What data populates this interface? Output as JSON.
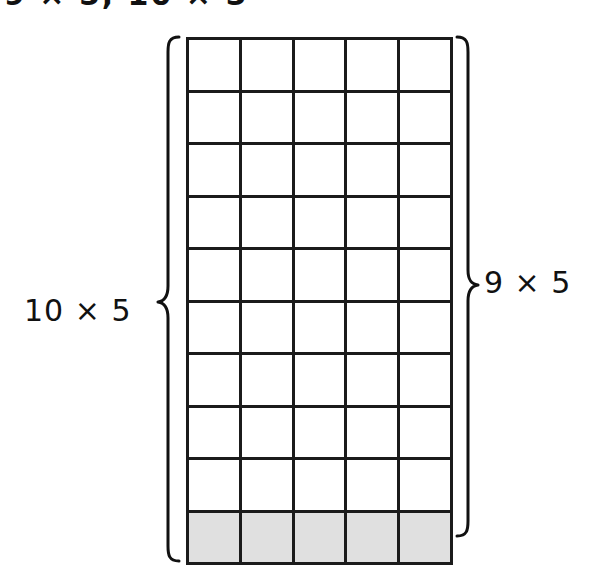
{
  "heading": {
    "text": "9 × 5, 10 × 5",
    "note": "cropped-top-text"
  },
  "diagram": {
    "type": "area-model-grid",
    "columns": 5,
    "rows": 10,
    "shaded_rows": 1,
    "unshaded_rows": 9,
    "shaded_row_indices": [
      9
    ],
    "grid_line_color": "#1b1b1b",
    "shaded_fill_color": "#e0e0e0",
    "unshaded_fill_color": "#ffffff"
  },
  "left_brace": {
    "label": "10 × 5",
    "spans_rows": 10,
    "glyph": "left-curly-brace"
  },
  "right_brace": {
    "label": "9 × 5",
    "spans_rows": 9,
    "glyph": "right-curly-brace"
  },
  "chart_data": {
    "type": "table",
    "title": "9 × 5, 10 × 5",
    "columns": 5,
    "rows": 10,
    "cell_width_px": 52.8,
    "cell_height_px": 52.5,
    "series": [
      {
        "name": "10 × 5",
        "values": [
          10,
          5
        ],
        "product": 50,
        "position": "left"
      },
      {
        "name": "9 × 5",
        "values": [
          9,
          5
        ],
        "product": 45,
        "position": "right"
      }
    ],
    "categories": [
      "10 × 5",
      "9 × 5"
    ],
    "values": [
      50,
      45
    ],
    "legend_position": "none",
    "grid": true
  }
}
